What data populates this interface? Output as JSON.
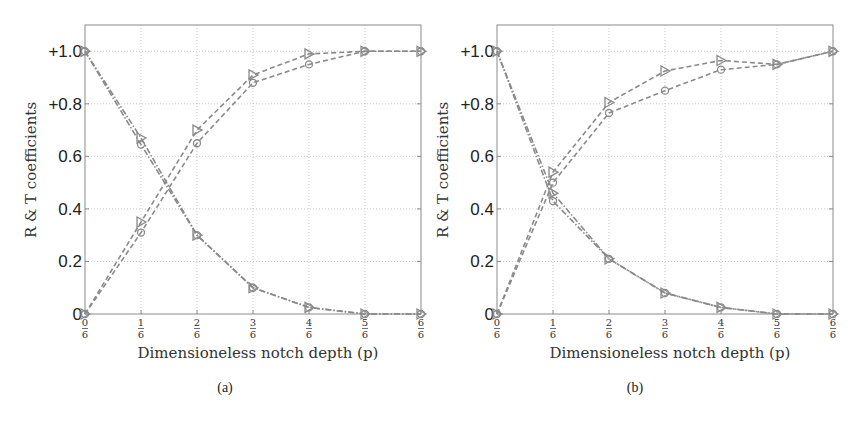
{
  "chart_data": [
    {
      "type": "line",
      "panel": "(a)",
      "caption": "(a)",
      "xlabel": "Dimensioneless notch depth (p)",
      "ylabel": "R & T coefficients",
      "x": [
        0,
        0.1667,
        0.3333,
        0.5,
        0.6667,
        0.8333,
        1.0
      ],
      "x_tick_labels": [
        [
          "0",
          "6"
        ],
        [
          "1",
          "6"
        ],
        [
          "2",
          "6"
        ],
        [
          "3",
          "6"
        ],
        [
          "4",
          "6"
        ],
        [
          "5",
          "6"
        ],
        [
          "6",
          "6"
        ]
      ],
      "y_tick_values": [
        0,
        0.2,
        0.4,
        0.6,
        0.8,
        1.0
      ],
      "y_tick_labels": [
        "0",
        "0.2",
        "0.4",
        "0.6",
        "+0.8",
        "+1.0"
      ],
      "xlim": [
        0,
        1
      ],
      "ylim": [
        0,
        1.1
      ],
      "grid": true,
      "series": [
        {
          "name": "R (triangle)",
          "marker": "triangle-right",
          "linestyle": "dash-dot",
          "values": [
            1.0,
            0.67,
            0.3,
            0.1,
            0.025,
            0.0,
            0.0
          ]
        },
        {
          "name": "R (circle)",
          "marker": "circle",
          "linestyle": "dash-dot",
          "values": [
            1.0,
            0.645,
            0.3,
            0.1,
            0.025,
            0.0,
            0.0
          ]
        },
        {
          "name": "T (triangle)",
          "marker": "triangle-right",
          "linestyle": "dashed",
          "values": [
            0.0,
            0.35,
            0.7,
            0.91,
            0.99,
            1.0,
            1.0
          ]
        },
        {
          "name": "T (circle)",
          "marker": "circle",
          "linestyle": "dashed",
          "values": [
            0.0,
            0.31,
            0.65,
            0.88,
            0.95,
            1.0,
            1.0
          ]
        }
      ]
    },
    {
      "type": "line",
      "panel": "(b)",
      "caption": "(b)",
      "xlabel": "Dimensioneless notch depth (p)",
      "ylabel": "R & T coefficients",
      "x": [
        0,
        0.1667,
        0.3333,
        0.5,
        0.6667,
        0.8333,
        1.0
      ],
      "x_tick_labels": [
        [
          "0",
          "6"
        ],
        [
          "1",
          "6"
        ],
        [
          "2",
          "6"
        ],
        [
          "3",
          "6"
        ],
        [
          "4",
          "6"
        ],
        [
          "5",
          "6"
        ],
        [
          "6",
          "6"
        ]
      ],
      "y_tick_values": [
        0,
        0.2,
        0.4,
        0.6,
        0.8,
        1.0
      ],
      "y_tick_labels": [
        "0",
        "0.2",
        "0.4",
        "0.6",
        "+0.8",
        "+1.0"
      ],
      "xlim": [
        0,
        1
      ],
      "ylim": [
        0,
        1.1
      ],
      "grid": true,
      "series": [
        {
          "name": "R (triangle)",
          "marker": "triangle-right",
          "linestyle": "dash-dot",
          "values": [
            1.0,
            0.46,
            0.21,
            0.08,
            0.025,
            0.0,
            0.0
          ]
        },
        {
          "name": "R (circle)",
          "marker": "circle",
          "linestyle": "dash-dot",
          "values": [
            1.0,
            0.43,
            0.21,
            0.08,
            0.025,
            0.0,
            0.0
          ]
        },
        {
          "name": "T (triangle)",
          "marker": "triangle-right",
          "linestyle": "dashed",
          "values": [
            0.0,
            0.54,
            0.805,
            0.925,
            0.965,
            0.95,
            1.0
          ]
        },
        {
          "name": "T (circle)",
          "marker": "circle",
          "linestyle": "dashed",
          "values": [
            0.0,
            0.5,
            0.765,
            0.85,
            0.93,
            0.95,
            1.0
          ]
        }
      ]
    }
  ],
  "style": {
    "line_color": "#8a8a8a",
    "marker_color": "#8a8a8a",
    "frame_color": "#8a8a8a",
    "grid_color": "#bbbbbb"
  }
}
